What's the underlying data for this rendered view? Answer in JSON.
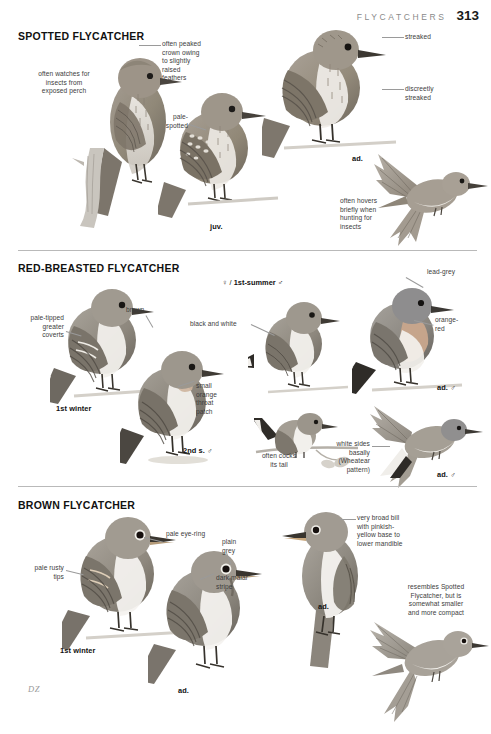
{
  "header": {
    "title": "FLYCATCHERS",
    "page_number": "313"
  },
  "signature": "DZ",
  "sections": [
    {
      "id": "spotted-flycatcher",
      "heading": "SPOTTED FLYCATCHER",
      "annotations": [
        {
          "name": "annotation-peaked-crown",
          "text": "often peaked\ncrown owing\nto slightly\nraised\nfeathers"
        },
        {
          "name": "annotation-watches-insects",
          "text": "often watches for\ninsects from\nexposed perch"
        },
        {
          "name": "annotation-pale-spotted",
          "text": "pale-\nspotted"
        },
        {
          "name": "annotation-streaked",
          "text": "streaked"
        },
        {
          "name": "annotation-discreetly-streaked",
          "text": "discreetly\nstreaked"
        },
        {
          "name": "annotation-hovers",
          "text": "often hovers\nbriefly when\nhunting for\ninsects"
        }
      ],
      "captions": [
        {
          "name": "caption-juvenile",
          "text": "juv."
        },
        {
          "name": "caption-adult",
          "text": "ad."
        }
      ]
    },
    {
      "id": "red-breasted-flycatcher",
      "heading": "RED-BREASTED FLYCATCHER",
      "annotations": [
        {
          "name": "annotation-pale-tipped-coverts",
          "text": "pale-tipped\ngreater\ncoverts"
        },
        {
          "name": "annotation-brown",
          "text": "brown"
        },
        {
          "name": "annotation-black-and-white",
          "text": "black and white"
        },
        {
          "name": "annotation-small-orange-throat-patch",
          "text": "small\norange\nthroat\npatch"
        },
        {
          "name": "annotation-lead-grey",
          "text": "lead-grey"
        },
        {
          "name": "annotation-orange-red",
          "text": "orange-\nred"
        },
        {
          "name": "annotation-cocks-tail",
          "text": "often cocks\nits tail"
        },
        {
          "name": "annotation-white-sides",
          "text": "white sides\nbasally\n(Wheatear\npattern)"
        }
      ],
      "captions": [
        {
          "name": "caption-female-1st-summer-male",
          "text": "♀ / 1st-summer ♂"
        },
        {
          "name": "caption-1st-winter",
          "text": "1st winter"
        },
        {
          "name": "caption-2nd-summer-male",
          "text": "2nd s. ♂"
        },
        {
          "name": "caption-adult-male-perched",
          "text": "ad. ♂"
        },
        {
          "name": "caption-adult-male-flight",
          "text": "ad. ♂"
        }
      ]
    },
    {
      "id": "brown-flycatcher",
      "heading": "BROWN FLYCATCHER",
      "annotations": [
        {
          "name": "annotation-pale-eye-ring",
          "text": "pale eye-ring"
        },
        {
          "name": "annotation-pale-rusty-tips",
          "text": "pale rusty\ntips"
        },
        {
          "name": "annotation-plain-grey",
          "text": "plain\ngrey"
        },
        {
          "name": "annotation-dark-malar-stripe",
          "text": "dark malar\nstripe"
        },
        {
          "name": "annotation-broad-bill",
          "text": "very broad bill\nwith pinkish-\nyellow base to\nlower mandible"
        },
        {
          "name": "annotation-resembles-spotted",
          "text": "resembles Spotted\nFlycatcher, but is\nsomewhat smaller\nand more compact"
        }
      ],
      "captions": [
        {
          "name": "caption-1st-winter",
          "text": "1st winter"
        },
        {
          "name": "caption-adult-left",
          "text": "ad."
        },
        {
          "name": "caption-adult-right",
          "text": "ad."
        }
      ]
    }
  ],
  "colors": {
    "page_background": "#ffffff",
    "heading_text": "#111111",
    "annotation_text": "#3c3c3c",
    "header_text": "#8a8a8a",
    "rule": "#b9b9b9",
    "leader_line": "#9a9a9a",
    "plumage_warm_brown": "#8f8377",
    "plumage_grey_brown": "#9a948c",
    "plumage_pale_belly": "#ebe8e3",
    "plumage_dark_wing": "#5d564f"
  }
}
